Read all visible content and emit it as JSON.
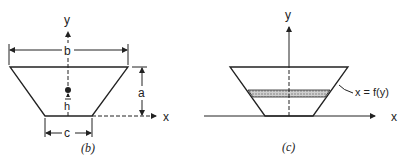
{
  "figure_b": {
    "caption": "(b)",
    "labels": {
      "y_axis": "y",
      "x_axis": "x",
      "top_width": "b",
      "bottom_width": "c",
      "height": "a",
      "centroid_height": "h"
    }
  },
  "figure_c": {
    "caption": "(c)",
    "labels": {
      "y_axis": "y",
      "x_axis": "x",
      "curve": "x = f(y)"
    }
  },
  "colors": {
    "line": "#222222",
    "hatch": "#9a9a9a",
    "background": "#ffffff"
  }
}
